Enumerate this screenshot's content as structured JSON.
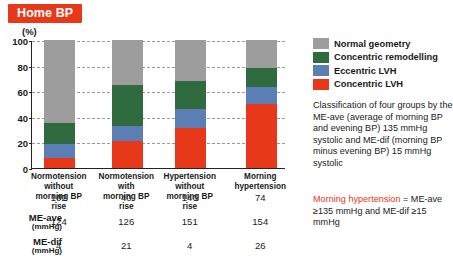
{
  "title": "Home BP",
  "accent_color": "#e8381a",
  "axis": {
    "unit_label": "(%)",
    "ticks": [
      0,
      20,
      40,
      60,
      80,
      100
    ],
    "ylim": [
      0,
      100
    ]
  },
  "legend": {
    "items": [
      {
        "label": "Normal geometry",
        "color": "#9d9d9d",
        "icon": "color-swatch"
      },
      {
        "label": "Concentric remodelling",
        "color": "#2f6b3f",
        "icon": "color-swatch"
      },
      {
        "label": "Eccentric LVH",
        "color": "#5b7fb4",
        "icon": "color-swatch"
      },
      {
        "label": "Concentric LVH",
        "color": "#e8381a",
        "icon": "color-swatch"
      }
    ]
  },
  "notes": {
    "classification": "Classification of four groups by the ME-ave (average of morning BP and evening BP) 135 mmHg systolic and ME-dif (morning BP minus evening BP) 15 mmHg systolic",
    "morning_hypertension_head": "Morning hypertension",
    "morning_hypertension_body": "= ME-ave ≥135 mmHg and ME-dif ≥15 mmHg"
  },
  "table": {
    "rows": [
      {
        "label": "n",
        "unit": "",
        "italic": true,
        "values": [
          "102",
          "40",
          "140",
          "74"
        ]
      },
      {
        "label": "ME-ave",
        "unit": "(mmHg)",
        "italic": false,
        "values": [
          "124",
          "126",
          "151",
          "154"
        ]
      },
      {
        "label": "ME-dif",
        "unit": "(mmHg)",
        "italic": false,
        "values": [
          "4",
          "21",
          "4",
          "26"
        ]
      }
    ]
  },
  "chart_data": {
    "type": "bar",
    "title": "Home BP",
    "xlabel": "",
    "ylabel": "(%)",
    "ylim": [
      0,
      100
    ],
    "yticks": [
      0,
      20,
      40,
      60,
      80,
      100
    ],
    "grid": true,
    "stacked": true,
    "legend_position": "right",
    "categories": [
      "Normotension without morning BP rise",
      "Normotension with morning BP rise",
      "Hypertension without morning BP rise",
      "Morning hypertension"
    ],
    "category_lines": [
      [
        "Normotension",
        "without",
        "morning BP rise"
      ],
      [
        "Normotension",
        "with",
        "morning BP rise"
      ],
      [
        "Hypertension",
        "without",
        "morning BP rise"
      ],
      [
        "Morning",
        "hypertension"
      ]
    ],
    "series": [
      {
        "name": "Concentric LVH",
        "color": "#e8381a",
        "values": [
          8,
          21,
          31,
          50
        ]
      },
      {
        "name": "Eccentric LVH",
        "color": "#5b7fb4",
        "values": [
          11,
          12,
          15,
          13
        ]
      },
      {
        "name": "Concentric remodelling",
        "color": "#2f6b3f",
        "values": [
          16,
          32,
          22,
          15
        ]
      },
      {
        "name": "Normal geometry",
        "color": "#9d9d9d",
        "values": [
          65,
          35,
          32,
          22
        ]
      }
    ],
    "cumulative_tops": [
      [
        8,
        19,
        35,
        100
      ],
      [
        21,
        33,
        65,
        100
      ],
      [
        31,
        46,
        68,
        100
      ],
      [
        50,
        63,
        78,
        100
      ]
    ],
    "annotations": {
      "n": [
        102,
        40,
        140,
        74
      ],
      "ME_ave_mmHg": [
        124,
        126,
        151,
        154
      ],
      "ME_dif_mmHg": [
        4,
        21,
        4,
        26
      ]
    }
  }
}
